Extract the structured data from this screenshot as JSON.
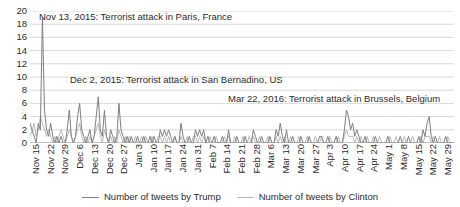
{
  "chart_data": {
    "type": "line",
    "title": "",
    "subtitle": "",
    "xlabel": "",
    "ylabel": "",
    "ylim": [
      0,
      20
    ],
    "ytick_step": 2,
    "yticks": [
      "0",
      "2",
      "4",
      "6",
      "8",
      "10",
      "12",
      "14",
      "16",
      "18",
      "20"
    ],
    "grid": "horizontal",
    "legend_position": "bottom-center",
    "x_tick_labels": [
      "Nov 15",
      "Nov 22",
      "Nov 29",
      "Dec 6",
      "Dec 13",
      "Dec 20",
      "Dec 27",
      "Jan 3",
      "Jan 10",
      "Jan 17",
      "Jan 24",
      "Jan 31",
      "Feb 7",
      "Feb 14",
      "Feb 21",
      "Feb 28",
      "Mar 6",
      "Mar 13",
      "Mar 20",
      "Mar 27",
      "Apr 3",
      "Apr 10",
      "Apr 17",
      "Apr 24",
      "May 1",
      "May 8",
      "May 15",
      "May 22",
      "May 29"
    ],
    "x_tick_interval_days": 7,
    "x_domain_days": 203,
    "colors": {
      "trump": "#808080",
      "clinton": "#b9b9b9",
      "grid": "#d9d9d9",
      "axis": "#9a9a9a",
      "text": "#2b2b2b"
    },
    "series": [
      {
        "name": "Number of tweets by Trump",
        "color": "#808080",
        "values": [
          3,
          2,
          1,
          0,
          3,
          2,
          19,
          5,
          2,
          1,
          3,
          1,
          0,
          1,
          0,
          1,
          0,
          0,
          2,
          5,
          1,
          0,
          1,
          4,
          6,
          2,
          1,
          0,
          1,
          2,
          0,
          1,
          4,
          7,
          2,
          1,
          5,
          1,
          0,
          2,
          1,
          0,
          1,
          6,
          2,
          1,
          0,
          1,
          0,
          1,
          0,
          0,
          1,
          0,
          0,
          1,
          0,
          0,
          1,
          0,
          1,
          0,
          0,
          2,
          1,
          2,
          1,
          2,
          1,
          0,
          1,
          0,
          0,
          3,
          1,
          0,
          0,
          1,
          0,
          0,
          2,
          1,
          2,
          1,
          2,
          0,
          1,
          0,
          0,
          1,
          0,
          0,
          0,
          1,
          0,
          0,
          2,
          0,
          0,
          0,
          1,
          0,
          0,
          0,
          1,
          0,
          0,
          0,
          2,
          1,
          0,
          0,
          1,
          0,
          0,
          0,
          1,
          0,
          0,
          2,
          1,
          3,
          1,
          0,
          2,
          0,
          0,
          1,
          0,
          0,
          0,
          1,
          0,
          0,
          0,
          1,
          0,
          0,
          0,
          0,
          1,
          1,
          0,
          0,
          1,
          0,
          0,
          0,
          1,
          0,
          0,
          0,
          2,
          5,
          4,
          2,
          3,
          1,
          2,
          1,
          0,
          0,
          1,
          0,
          0,
          0,
          0,
          1,
          0,
          0,
          0,
          0,
          0,
          1,
          0,
          0,
          0,
          0,
          0,
          1,
          0,
          0,
          0,
          1,
          0,
          0,
          0,
          0,
          1,
          0,
          2,
          1,
          3,
          4,
          1,
          0,
          1,
          0,
          0,
          0,
          0,
          1,
          0,
          0,
          0,
          0
        ]
      },
      {
        "name": "Number of tweets by Clinton",
        "color": "#b9b9b9",
        "values": [
          1,
          2,
          3,
          1,
          2,
          4,
          3,
          2,
          1,
          2,
          1,
          0,
          1,
          0,
          1,
          2,
          1,
          0,
          1,
          2,
          1,
          0,
          1,
          2,
          3,
          1,
          0,
          1,
          0,
          1,
          0,
          1,
          2,
          3,
          1,
          0,
          2,
          1,
          0,
          1,
          0,
          1,
          0,
          2,
          1,
          0,
          1,
          0,
          1,
          0,
          0,
          1,
          0,
          0,
          1,
          0,
          1,
          0,
          0,
          1,
          0,
          0,
          1,
          1,
          0,
          1,
          0,
          1,
          0,
          0,
          1,
          0,
          0,
          1,
          0,
          0,
          1,
          0,
          0,
          1,
          1,
          0,
          1,
          0,
          1,
          0,
          0,
          1,
          0,
          0,
          1,
          0,
          0,
          0,
          1,
          0,
          1,
          0,
          0,
          1,
          0,
          0,
          0,
          1,
          0,
          0,
          1,
          0,
          1,
          0,
          0,
          1,
          0,
          0,
          0,
          1,
          0,
          0,
          0,
          1,
          0,
          1,
          0,
          1,
          0,
          0,
          1,
          0,
          0,
          0,
          1,
          0,
          0,
          0,
          1,
          0,
          0,
          0,
          1,
          0,
          0,
          1,
          0,
          0,
          0,
          1,
          0,
          0,
          0,
          1,
          0,
          0,
          1,
          2,
          1,
          1,
          1,
          0,
          1,
          0,
          1,
          0,
          0,
          1,
          0,
          0,
          1,
          0,
          0,
          1,
          0,
          0,
          0,
          0,
          1,
          0,
          0,
          1,
          0,
          0,
          0,
          1,
          0,
          0,
          0,
          1,
          0,
          0,
          0,
          1,
          0,
          1,
          1,
          1,
          0,
          1,
          0,
          0,
          1,
          0,
          0,
          0,
          1,
          0,
          0,
          0
        ]
      }
    ],
    "annotations": [
      {
        "id": "paris",
        "text": "Nov 13, 2015: Terrorist attack in Paris, France",
        "x_px": 39,
        "y_px": 12
      },
      {
        "id": "san-bernadino",
        "text": "Dec 2, 2015: Terrorist attack in San Bernadino, US",
        "x_px": 70,
        "y_px": 75
      },
      {
        "id": "brussels",
        "text": "Mar 22, 2016: Terrorist attack in Brussels, Belgium",
        "x_px": 228,
        "y_px": 94
      }
    ]
  },
  "legend": {
    "entries": [
      {
        "label": "Number of tweets by Trump",
        "color": "#808080"
      },
      {
        "label": "Number of tweets by Clinton",
        "color": "#b9b9b9"
      }
    ]
  }
}
